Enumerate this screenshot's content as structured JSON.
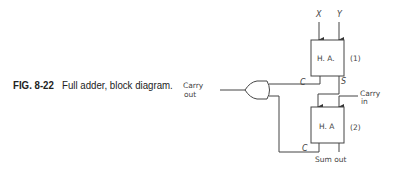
{
  "caption": {
    "fig_label": "FIG. 8-22",
    "text": "Full adder, block diagram."
  },
  "diagram": {
    "inputs": {
      "x": "X",
      "y": "Y",
      "carry_in": [
        "Carry",
        "in"
      ]
    },
    "half_adder_1": {
      "label": "H. A.",
      "index": "(1)",
      "carry_port": "C",
      "sum_port": "S"
    },
    "half_adder_2": {
      "label": "H. A",
      "index": "(2)",
      "carry_port": "C"
    },
    "or_gate": {
      "output_label": [
        "Carry",
        "out"
      ]
    },
    "sum_output": "Sum out"
  }
}
